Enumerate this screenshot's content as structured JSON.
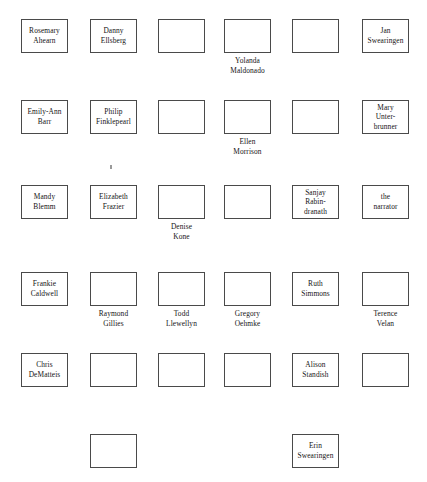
{
  "chart": {
    "columns": 6,
    "rows": 6,
    "box_width": 47,
    "box_height": 34,
    "colors": {
      "background": "#ffffff",
      "box_border": "#4a4a4a",
      "box_fill": "#ffffff",
      "text": "#151515",
      "stray_mark": "#9a9a9a"
    }
  },
  "seats": [
    {
      "id": "seat-r1c1",
      "row": 1,
      "col": 1,
      "x": 21,
      "y": 19,
      "label": "Rosemary\nAhearn",
      "label_position": "inside",
      "empty": false
    },
    {
      "id": "seat-r1c2",
      "row": 1,
      "col": 2,
      "x": 90,
      "y": 19,
      "label": "Danny\nEllsberg",
      "label_position": "inside",
      "empty": false
    },
    {
      "id": "seat-r1c3",
      "row": 1,
      "col": 3,
      "x": 158,
      "y": 19,
      "label": "",
      "label_position": "none",
      "empty": true
    },
    {
      "id": "seat-r1c4",
      "row": 1,
      "col": 4,
      "x": 224,
      "y": 19,
      "label": "Yolanda\nMaldonado",
      "label_position": "below",
      "empty": true
    },
    {
      "id": "seat-r1c5",
      "row": 1,
      "col": 5,
      "x": 292,
      "y": 19,
      "label": "",
      "label_position": "none",
      "empty": true
    },
    {
      "id": "seat-r1c6",
      "row": 1,
      "col": 6,
      "x": 362,
      "y": 19,
      "label": "Jan\nSwearingen",
      "label_position": "inside",
      "empty": false
    },
    {
      "id": "seat-r2c1",
      "row": 2,
      "col": 1,
      "x": 21,
      "y": 100,
      "label": "Emily-Ann\nBarr",
      "label_position": "inside",
      "empty": false
    },
    {
      "id": "seat-r2c2",
      "row": 2,
      "col": 2,
      "x": 90,
      "y": 100,
      "label": "Philip\nFinklepearl",
      "label_position": "inside",
      "empty": false
    },
    {
      "id": "seat-r2c3",
      "row": 2,
      "col": 3,
      "x": 158,
      "y": 100,
      "label": "",
      "label_position": "none",
      "empty": true
    },
    {
      "id": "seat-r2c4",
      "row": 2,
      "col": 4,
      "x": 224,
      "y": 100,
      "label": "Ellen\nMorrison",
      "label_position": "below",
      "empty": true
    },
    {
      "id": "seat-r2c5",
      "row": 2,
      "col": 5,
      "x": 292,
      "y": 100,
      "label": "",
      "label_position": "none",
      "empty": true
    },
    {
      "id": "seat-r2c6",
      "row": 2,
      "col": 6,
      "x": 362,
      "y": 100,
      "label": "Mary\nUnter-\nbrunner",
      "label_position": "inside",
      "empty": false
    },
    {
      "id": "seat-r3c1",
      "row": 3,
      "col": 1,
      "x": 21,
      "y": 185,
      "label": "Mandy\nBlemm",
      "label_position": "inside",
      "empty": false
    },
    {
      "id": "seat-r3c2",
      "row": 3,
      "col": 2,
      "x": 90,
      "y": 185,
      "label": "Elizabeth\nFrazier",
      "label_position": "inside",
      "empty": false
    },
    {
      "id": "seat-r3c3",
      "row": 3,
      "col": 3,
      "x": 158,
      "y": 185,
      "label": "Denise\nKone",
      "label_position": "below",
      "empty": true
    },
    {
      "id": "seat-r3c4",
      "row": 3,
      "col": 4,
      "x": 224,
      "y": 185,
      "label": "",
      "label_position": "none",
      "empty": true
    },
    {
      "id": "seat-r3c5",
      "row": 3,
      "col": 5,
      "x": 292,
      "y": 185,
      "label": "Sanjay\nRabin-\ndranath",
      "label_position": "inside",
      "empty": false
    },
    {
      "id": "seat-r3c6",
      "row": 3,
      "col": 6,
      "x": 362,
      "y": 185,
      "label": "the\nnarrator",
      "label_position": "inside",
      "empty": false
    },
    {
      "id": "seat-r4c1",
      "row": 4,
      "col": 1,
      "x": 21,
      "y": 272,
      "label": "Frankie\nCaldwell",
      "label_position": "inside",
      "empty": false
    },
    {
      "id": "seat-r4c2",
      "row": 4,
      "col": 2,
      "x": 90,
      "y": 272,
      "label": "Raymond\nGillies",
      "label_position": "below",
      "empty": true
    },
    {
      "id": "seat-r4c3",
      "row": 4,
      "col": 3,
      "x": 158,
      "y": 272,
      "label": "Todd\nLlewellyn",
      "label_position": "below",
      "empty": true
    },
    {
      "id": "seat-r4c4",
      "row": 4,
      "col": 4,
      "x": 224,
      "y": 272,
      "label": "Gregory\nOehmke",
      "label_position": "below",
      "empty": true
    },
    {
      "id": "seat-r4c5",
      "row": 4,
      "col": 5,
      "x": 292,
      "y": 272,
      "label": "Ruth\nSimmons",
      "label_position": "inside",
      "empty": false
    },
    {
      "id": "seat-r4c6",
      "row": 4,
      "col": 6,
      "x": 362,
      "y": 272,
      "label": "Terence\nVelan",
      "label_position": "below",
      "empty": true
    },
    {
      "id": "seat-r5c1",
      "row": 5,
      "col": 1,
      "x": 21,
      "y": 353,
      "label": "Chris\nDeMatteis",
      "label_position": "inside",
      "empty": false
    },
    {
      "id": "seat-r5c2",
      "row": 5,
      "col": 2,
      "x": 90,
      "y": 353,
      "label": "",
      "label_position": "none",
      "empty": true
    },
    {
      "id": "seat-r5c3",
      "row": 5,
      "col": 3,
      "x": 158,
      "y": 353,
      "label": "",
      "label_position": "none",
      "empty": true
    },
    {
      "id": "seat-r5c4",
      "row": 5,
      "col": 4,
      "x": 224,
      "y": 353,
      "label": "",
      "label_position": "none",
      "empty": true
    },
    {
      "id": "seat-r5c5",
      "row": 5,
      "col": 5,
      "x": 292,
      "y": 353,
      "label": "Alison\nStandish",
      "label_position": "inside",
      "empty": false
    },
    {
      "id": "seat-r5c6",
      "row": 5,
      "col": 6,
      "x": 362,
      "y": 353,
      "label": "",
      "label_position": "none",
      "empty": true
    },
    {
      "id": "seat-r6c2",
      "row": 6,
      "col": 2,
      "x": 90,
      "y": 434,
      "label": "",
      "label_position": "none",
      "empty": true
    },
    {
      "id": "seat-r6c5",
      "row": 6,
      "col": 5,
      "x": 292,
      "y": 434,
      "label": "Erin\nSwearingen",
      "label_position": "inside",
      "empty": false
    }
  ],
  "marks": [
    {
      "id": "stray-mark-1",
      "x": 110,
      "y": 165
    }
  ]
}
